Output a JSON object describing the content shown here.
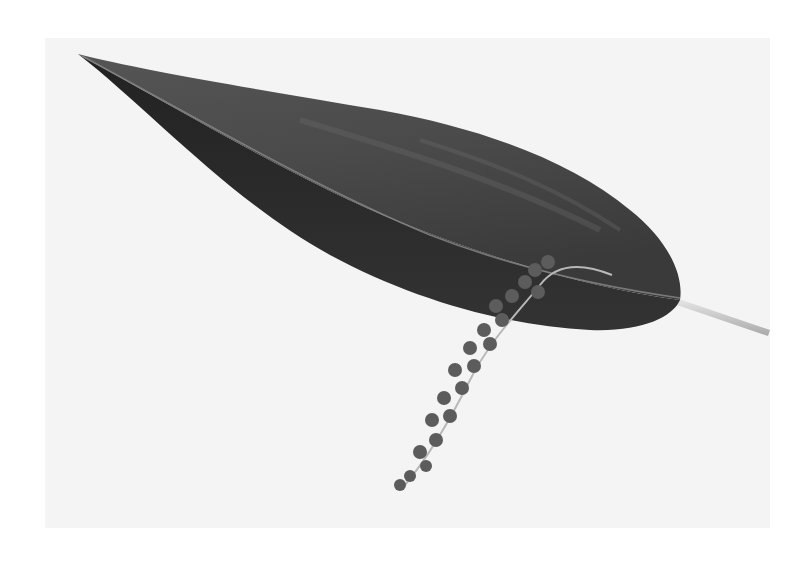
{
  "image": {
    "subject": "Dark leaf with hanging bead-like flower spike on pale background",
    "style": "black-and-white photograph",
    "colors": {
      "page_background": "#ffffff",
      "photo_background": "#f4f4f4",
      "leaf_dark": "#2a2a2a",
      "leaf_mid": "#4a4a4a",
      "leaf_highlight": "#6a6a6a",
      "flowers": "#5a5a5a",
      "stem": "#cfcfcf"
    }
  }
}
